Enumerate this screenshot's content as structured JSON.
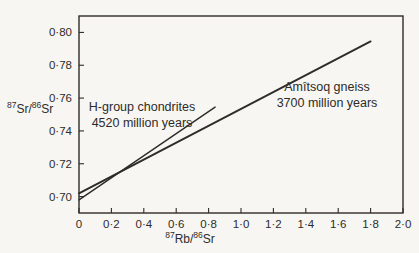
{
  "figure": {
    "background": "#f7f6f3",
    "ink": "#2e2c29"
  },
  "chart_data": {
    "type": "line",
    "title": "",
    "xlabel": {
      "sup1": "87",
      "base1": "Rb/",
      "sup2": "86",
      "base2": "Sr"
    },
    "ylabel": {
      "sup1": "87",
      "base1": "Sr/",
      "sup2": "86",
      "base2": "Sr"
    },
    "xlim": [
      0,
      2.0
    ],
    "ylim": [
      0.69,
      0.81
    ],
    "grid": false,
    "frame": "box",
    "x_ticks": [
      {
        "value": 0,
        "label": "0"
      },
      {
        "value": 0.2,
        "label": "0·2"
      },
      {
        "value": 0.4,
        "label": "0·4"
      },
      {
        "value": 0.6,
        "label": "0·6"
      },
      {
        "value": 0.8,
        "label": "0·8"
      },
      {
        "value": 1.0,
        "label": "1·0"
      },
      {
        "value": 1.2,
        "label": "1·2"
      },
      {
        "value": 1.4,
        "label": "1·4"
      },
      {
        "value": 1.6,
        "label": "1·6"
      },
      {
        "value": 1.8,
        "label": "1·8"
      },
      {
        "value": 2.0,
        "label": "2·0"
      }
    ],
    "y_ticks": [
      {
        "value": 0.7,
        "label": "0·70"
      },
      {
        "value": 0.72,
        "label": "0·72"
      },
      {
        "value": 0.74,
        "label": "0·74"
      },
      {
        "value": 0.76,
        "label": "0·76"
      },
      {
        "value": 0.78,
        "label": "0·78"
      },
      {
        "value": 0.8,
        "label": "0·80"
      }
    ],
    "series": [
      {
        "name": "H-group chondrites",
        "age_label": "4520 million years",
        "points": [
          [
            0,
            0.698
          ],
          [
            0.84,
            0.7545
          ]
        ]
      },
      {
        "name": "Amîtsoq gneiss",
        "age_label": "3700 million years",
        "points": [
          [
            0,
            0.702
          ],
          [
            1.8,
            0.7945
          ]
        ]
      }
    ]
  }
}
